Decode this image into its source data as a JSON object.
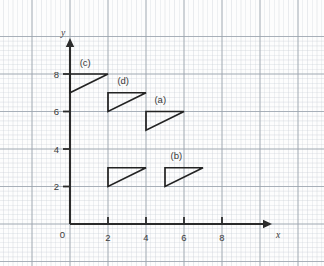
{
  "figure": {
    "background_color": "#fdfdfd",
    "width": 324,
    "height": 266
  },
  "chart_data": {
    "type": "scatter",
    "title": "",
    "subtitle": "",
    "xlabel": "x",
    "ylabel": "y",
    "xlim": [
      -3.7,
      13.4
    ],
    "ylim": [
      -2.2,
      10.0
    ],
    "grid": true,
    "grid_minor_step": 0.25,
    "grid_major_step": 2,
    "legend_position": "none",
    "axis_origin": [
      0,
      0
    ],
    "x_ticks": [
      2,
      4,
      6,
      8
    ],
    "x_tick_labels": [
      "2",
      "4",
      "6",
      "8"
    ],
    "y_ticks": [
      2,
      4,
      6,
      8
    ],
    "y_tick_labels": [
      "2",
      "4",
      "6",
      "8"
    ],
    "origin_label": "0",
    "x_axis_label": "x",
    "y_axis_label": "y",
    "shapes": [
      {
        "name": "triangle-a",
        "label": "(a)",
        "label_position": [
          4.75,
          6.45
        ],
        "vertices": [
          [
            4,
            5
          ],
          [
            4,
            6
          ],
          [
            6,
            6
          ]
        ],
        "closed": true,
        "legs": {
          "vertical": 1,
          "horizontal": 2
        }
      },
      {
        "name": "triangle-b",
        "label": "(b)",
        "label_position": [
          5.6,
          3.45
        ],
        "vertices": [
          [
            5,
            2
          ],
          [
            5,
            3
          ],
          [
            7,
            3
          ]
        ],
        "closed": true,
        "legs": {
          "vertical": 1,
          "horizontal": 2
        }
      },
      {
        "name": "triangle-c",
        "label": "(c)",
        "label_position": [
          0.8,
          8.45
        ],
        "vertices": [
          [
            0,
            7
          ],
          [
            2,
            8
          ],
          [
            0,
            8
          ]
        ],
        "closed": true,
        "legs": {
          "vertical": 1,
          "horizontal": 2
        }
      },
      {
        "name": "triangle-d",
        "label": "(d)",
        "label_position": [
          2.8,
          7.45
        ],
        "vertices": [
          [
            2,
            6
          ],
          [
            2,
            7
          ],
          [
            4,
            7
          ]
        ],
        "closed": true,
        "legs": {
          "vertical": 1,
          "horizontal": 2
        }
      },
      {
        "name": "triangle-unlabeled",
        "label": "",
        "label_position": null,
        "vertices": [
          [
            2,
            2
          ],
          [
            2,
            3
          ],
          [
            4,
            3
          ]
        ],
        "closed": true,
        "legs": {
          "vertical": 1,
          "horizontal": 2
        }
      }
    ],
    "colors": {
      "axis": "#2b2b2b",
      "shape_stroke": "#232323",
      "grid_minor": "#c9cfd6",
      "grid_major": "#9aa3ad",
      "text": "#3a3a3a"
    }
  }
}
